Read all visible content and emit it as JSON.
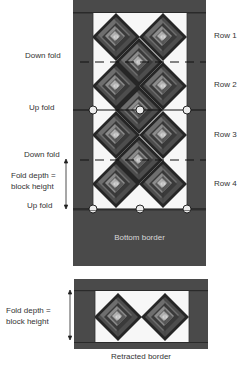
{
  "left_labels": {
    "down_fold_1": "Down fold",
    "up_fold_1": "Up fold",
    "down_fold_2": "Down fold",
    "fold_depth_line1": "Fold depth =",
    "fold_depth_line2": "block height",
    "up_fold_2": "Up fold"
  },
  "row_labels": [
    "Row 1",
    "Row 2",
    "Row 3",
    "Row 4"
  ],
  "bottom_border_label": "Bottom border",
  "retracted": {
    "fold_depth_line1": "Fold depth =",
    "fold_depth_line2": "block height",
    "caption": "Retracted border"
  },
  "colors": {
    "border_fill": "#4a4a4a",
    "panel_white": "#f7f7f7",
    "strip_dark": "#2a2a2a",
    "strip_mid_dark": "#555555",
    "strip_mid": "#7a7a7a",
    "strip_light": "#a5a5a5",
    "strip_lightest": "#cfcfcf"
  }
}
